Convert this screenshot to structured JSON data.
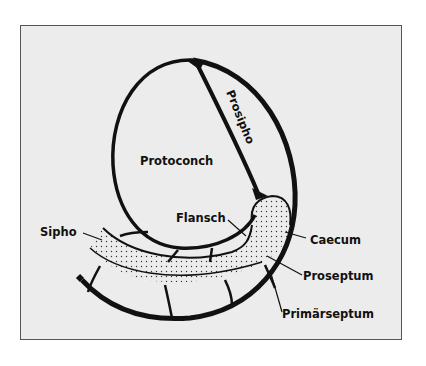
{
  "figure": {
    "background": "#ececec",
    "ink": "#111111",
    "labels": {
      "protoconch": "Protoconch",
      "prosipho": "Prosipho",
      "flansch": "Flansch",
      "sipho": "Sipho",
      "caecum": "Caecum",
      "proseptum": "Proseptum",
      "primaerseptum": "Primärseptum"
    }
  }
}
